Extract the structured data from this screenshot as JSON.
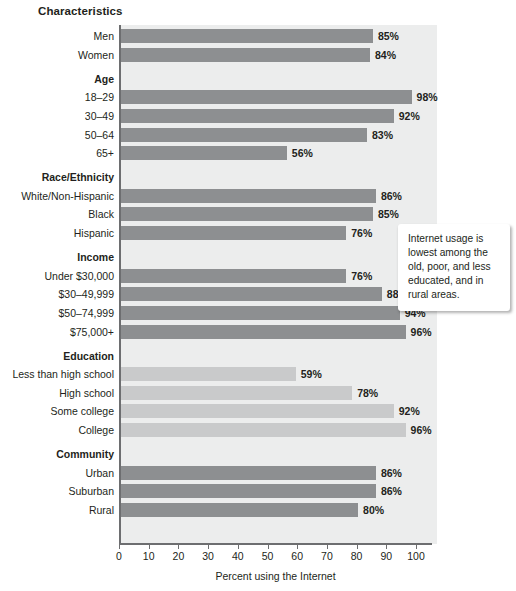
{
  "chart_data": {
    "type": "bar",
    "orientation": "horizontal",
    "title": "Characteristics",
    "xlabel": "Percent using the Internet",
    "ylabel": "",
    "xlim": [
      0,
      100
    ],
    "xticks": [
      0,
      10,
      20,
      30,
      40,
      50,
      60,
      70,
      80,
      90,
      100
    ],
    "grid": false,
    "legend": null,
    "value_suffix": "%",
    "colors": {
      "bar_default": "#8d8f91",
      "bar_light": "#c9cacb",
      "panel_background": "#eceded",
      "axis": "#6d6e70",
      "text": "#231f20",
      "callout_background": "#ffffff"
    },
    "groups": [
      {
        "name": "Characteristics",
        "is_title": true,
        "categories": [
          "Men",
          "Women"
        ],
        "values": [
          85,
          84
        ],
        "shade": "default"
      },
      {
        "name": "Age",
        "is_title": false,
        "categories": [
          "18–29",
          "30–49",
          "50–64",
          "65+"
        ],
        "values": [
          98,
          92,
          83,
          56
        ],
        "shade": "default"
      },
      {
        "name": "Race/Ethnicity",
        "is_title": false,
        "categories": [
          "White/Non-Hispanic",
          "Black",
          "Hispanic"
        ],
        "values": [
          86,
          85,
          76
        ],
        "shade": "default"
      },
      {
        "name": "Income",
        "is_title": false,
        "categories": [
          "Under $30,000",
          "$30–49,999",
          "$50–74,999",
          "$75,000+"
        ],
        "values": [
          76,
          88,
          94,
          96
        ],
        "shade": "default"
      },
      {
        "name": "Education",
        "is_title": false,
        "categories": [
          "Less than high school",
          "High school",
          "Some college",
          "College"
        ],
        "values": [
          59,
          78,
          92,
          96
        ],
        "shade": "light"
      },
      {
        "name": "Community",
        "is_title": false,
        "categories": [
          "Urban",
          "Suburban",
          "Rural"
        ],
        "values": [
          86,
          86,
          80
        ],
        "shade": "default"
      }
    ],
    "annotations": [
      {
        "name": "callout",
        "text": "Internet usage is lowest among the old, poor, and less educated, and in rural areas."
      }
    ]
  }
}
